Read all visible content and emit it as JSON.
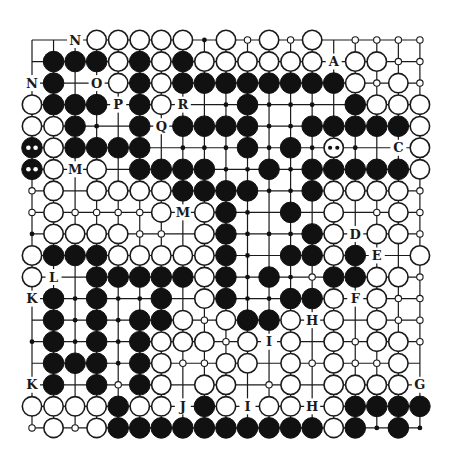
{
  "board": {
    "size": 19,
    "origin_x": 32,
    "origin_y": 40,
    "spacing": 21.55,
    "stone_radius": 10.3,
    "colors": {
      "black": "#111111",
      "white": "#ffffff",
      "line": "#1a1a1a"
    },
    "legend": {
      "B": "black stone",
      "W": "white stone",
      "MB": "black stone marked with two white dots",
      "MW": "white stone marked with two black dots",
      "b": "small black intersection dot",
      "w": "small white intersection circle",
      ".": "empty intersection",
      "-": "empty intersection (short tick)"
    },
    "rows": [
      [
        ".",
        ".",
        "N",
        "W",
        "W",
        "W",
        "W",
        "W",
        "b",
        "W",
        "w",
        "W",
        "w",
        "W",
        "-",
        "w",
        "w",
        "w",
        "w"
      ],
      [
        ".",
        "B",
        "B",
        "B",
        "W",
        "B",
        "W",
        "B",
        "W",
        "W",
        "W",
        "W",
        "W",
        "W",
        "A",
        "W",
        "W",
        "w",
        "w"
      ],
      [
        "N",
        "B",
        ".",
        "O",
        "W",
        "B",
        "W",
        "B",
        "B",
        "B",
        "B",
        "B",
        "B",
        "B",
        "B",
        "W",
        "w",
        "W",
        "w"
      ],
      [
        "W",
        "B",
        "B",
        "B",
        "P",
        "B",
        "W",
        "R",
        ".",
        "b",
        "B",
        "b",
        "b",
        "b",
        ".",
        "B",
        "W",
        "W",
        "W"
      ],
      [
        "W",
        "W",
        "B",
        "b",
        ".",
        "B",
        "Q",
        "B",
        "B",
        "B",
        "B",
        "b",
        "b",
        "B",
        "B",
        "B",
        "B",
        "B",
        "W"
      ],
      [
        "MB",
        "W",
        "B",
        "B",
        "B",
        "B",
        ".",
        "b",
        "b",
        "b",
        "B",
        "b",
        "B",
        "b",
        "MW",
        "b",
        ".",
        "C",
        "W"
      ],
      [
        "MB",
        "W",
        "M",
        "W",
        ".",
        "B",
        "B",
        "B",
        "B",
        "b",
        "b",
        "B",
        "b",
        "B",
        "B",
        "B",
        "B",
        "B",
        "W"
      ],
      [
        "w",
        "W",
        ".",
        "W",
        "W",
        "W",
        "W",
        "B",
        "B",
        "B",
        "B",
        "b",
        "b",
        "B",
        "W",
        "W",
        "W",
        "W",
        "w"
      ],
      [
        "w",
        "W",
        "w",
        "w",
        "w",
        "w",
        "W",
        "M",
        "W",
        "B",
        "b",
        ".",
        "B",
        ".",
        "W",
        ".",
        "w",
        "W",
        "w"
      ],
      [
        "b",
        "W",
        "W",
        "W",
        "W",
        "w",
        "w",
        ".",
        "W",
        "B",
        "b",
        "b",
        "b",
        "B",
        "W",
        "D",
        "W",
        "W",
        "w"
      ],
      [
        "W",
        "B",
        "B",
        "B",
        "W",
        "W",
        "W",
        "W",
        "W",
        "B",
        "b",
        ".",
        "B",
        "B",
        "W",
        "B",
        "E",
        ".",
        "W"
      ],
      [
        "W",
        "L",
        ".",
        "B",
        "B",
        "B",
        "B",
        "B",
        "W",
        "B",
        "b",
        "B",
        "b",
        "w",
        "B",
        "B",
        "W",
        "W",
        "w"
      ],
      [
        "K",
        "B",
        "b",
        "B",
        "b",
        "b",
        "B",
        ".",
        "W",
        "B",
        "b",
        "b",
        "B",
        "B",
        "W",
        "F",
        "W",
        "w",
        "w"
      ],
      [
        ".",
        "B",
        "b",
        "B",
        "b",
        "B",
        "B",
        "W",
        "w",
        "W",
        "B",
        "B",
        "W",
        "H",
        "W",
        ".",
        "W",
        "w",
        "w"
      ],
      [
        "b",
        "B",
        "b",
        "B",
        "b",
        "B",
        "W",
        "W",
        "W",
        "w",
        "W",
        "I",
        "W",
        ".",
        "W",
        "w",
        "W",
        "W",
        "w"
      ],
      [
        ".",
        "B",
        "B",
        "B",
        "b",
        "B",
        "W",
        "w",
        "w",
        "W",
        "W",
        ".",
        "W",
        "w",
        "W",
        "w",
        "w",
        "W",
        "."
      ],
      [
        "K",
        "B",
        ".",
        "B",
        "w",
        "B",
        "W",
        ".",
        "W",
        "W",
        ".",
        "w",
        "W",
        ".",
        "W",
        "W",
        "W",
        "W",
        "G"
      ],
      [
        "W",
        "W",
        "W",
        "W",
        "B",
        "W",
        "W",
        "J",
        "B",
        "W",
        "I",
        "W",
        "W",
        "H",
        "W",
        "B",
        "B",
        "B",
        "B"
      ],
      [
        "w",
        "W",
        "w",
        "W",
        "B",
        "B",
        "B",
        "B",
        "B",
        "B",
        "B",
        "B",
        "B",
        "B",
        "W",
        "B",
        "b",
        "B",
        "b"
      ]
    ],
    "labels": [
      "A",
      "B",
      "C",
      "D",
      "E",
      "F",
      "G",
      "H",
      "I",
      "J",
      "K",
      "L",
      "M",
      "N",
      "O",
      "P",
      "Q",
      "R"
    ]
  }
}
